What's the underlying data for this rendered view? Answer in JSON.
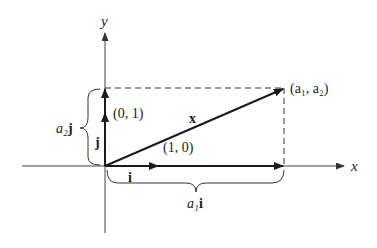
{
  "diagram": {
    "type": "vector-decomposition",
    "colors": {
      "ink": "#1a1a1a",
      "axis": "#444444",
      "background": "#ffffff"
    },
    "axes": {
      "x_label": "x",
      "y_label": "y"
    },
    "vectors": {
      "x_label": "x",
      "i_label": "i",
      "j_label": "j"
    },
    "points": {
      "endpoint_label": "(a₁, a₂)",
      "unit_x_label": "(1, 0)",
      "unit_y_label": "(0, 1)"
    },
    "braces": {
      "horizontal_label_coef": "a₁",
      "horizontal_label_vec": "i",
      "vertical_label_coef": "a₂",
      "vertical_label_vec": "j"
    }
  }
}
